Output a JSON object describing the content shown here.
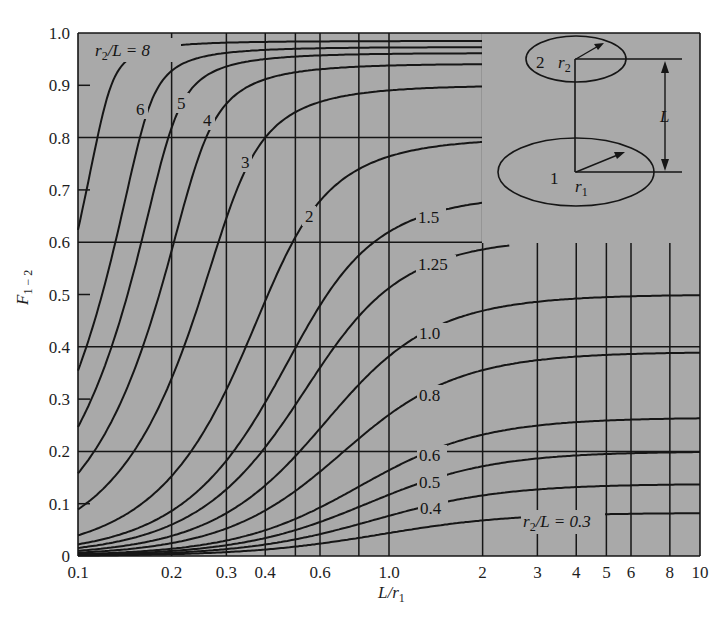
{
  "chart_data": {
    "type": "line",
    "title": "",
    "xlabel": "L/r1",
    "ylabel": "F1-2",
    "xscale": "log",
    "xlim": [
      0.1,
      10
    ],
    "ylim": [
      0,
      1.0
    ],
    "grid": true,
    "x_ticks": [
      0.1,
      0.2,
      0.3,
      0.4,
      0.6,
      1.0,
      2,
      3,
      4,
      5,
      6,
      8,
      10
    ],
    "x_tick_labels": [
      "0.1",
      "0.2",
      "0.3",
      "0.4",
      "0.6",
      "1.0",
      "2",
      "3",
      "4",
      "5",
      "6",
      "8",
      "10"
    ],
    "y_ticks": [
      0,
      0.1,
      0.2,
      0.3,
      0.4,
      0.5,
      0.6,
      0.7,
      0.8,
      0.9,
      1.0
    ],
    "y_tick_labels": [
      "0",
      "0.1",
      "0.2",
      "0.3",
      "0.4",
      "0.5",
      "0.6",
      "0.7",
      "0.8",
      "0.9",
      "1.0"
    ],
    "parameter": "r2/L",
    "x": [
      0.1,
      0.2,
      0.3,
      0.5,
      1.0,
      2,
      3,
      5,
      10
    ],
    "series": [
      {
        "name": "r2/L = 8",
        "r2L": 8,
        "label": "r2/L = 8",
        "values": [
          0.623,
          0.975,
          0.982,
          0.984,
          0.984,
          0.985,
          0.985,
          0.985,
          0.985
        ]
      },
      {
        "name": "r2/L = 6",
        "r2L": 6,
        "label": "6",
        "values": [
          0.355,
          0.928,
          0.962,
          0.97,
          0.973,
          0.973,
          0.973,
          0.973,
          0.973
        ]
      },
      {
        "name": "r2/L = 5",
        "r2L": 5,
        "label": "5",
        "values": [
          0.247,
          0.819,
          0.936,
          0.956,
          0.961,
          0.962,
          0.962,
          0.962,
          0.962
        ]
      },
      {
        "name": "r2/L = 4",
        "r2L": 4,
        "label": "4",
        "values": [
          0.158,
          0.584,
          0.865,
          0.925,
          0.94,
          0.941,
          0.941,
          0.941,
          0.941
        ]
      },
      {
        "name": "r2/L = 3",
        "r2L": 3,
        "label": "3",
        "values": [
          0.089,
          0.339,
          0.646,
          0.849,
          0.89,
          0.9,
          0.9,
          0.901,
          0.901
        ]
      },
      {
        "name": "r2/L = 2",
        "r2L": 2,
        "label": "2",
        "values": [
          0.04,
          0.153,
          0.318,
          0.61,
          0.764,
          0.79,
          0.797,
          0.8,
          0.801
        ]
      },
      {
        "name": "r2/L = 1.5",
        "r2L": 1.5,
        "label": "1.5",
        "values": [
          0.022,
          0.086,
          0.182,
          0.397,
          0.62,
          0.675,
          0.684,
          0.689,
          0.691
        ]
      },
      {
        "name": "r2/L = 1.25",
        "r2L": 1.25,
        "label": "1.25",
        "values": [
          0.016,
          0.06,
          0.127,
          0.289,
          0.512,
          0.586,
          0.6,
          0.607,
          0.609
        ]
      },
      {
        "name": "r2/L = 1.0",
        "r2L": 1.0,
        "label": "1.0",
        "values": [
          0.01,
          0.038,
          0.082,
          0.191,
          0.382,
          0.469,
          0.486,
          0.495,
          0.499
        ]
      },
      {
        "name": "r2/L = 0.8",
        "r2L": 0.8,
        "label": "0.8",
        "values": [
          0.006,
          0.025,
          0.053,
          0.125,
          0.27,
          0.355,
          0.374,
          0.385,
          0.389
        ]
      },
      {
        "name": "r2/L = 0.6",
        "r2L": 0.6,
        "label": "0.6",
        "values": [
          0.004,
          0.014,
          0.03,
          0.071,
          0.164,
          0.232,
          0.25,
          0.26,
          0.264
        ]
      },
      {
        "name": "r2/L = 0.5",
        "r2L": 0.5,
        "label": "0.5",
        "values": [
          0.003,
          0.01,
          0.021,
          0.05,
          0.117,
          0.172,
          0.187,
          0.196,
          0.199
        ]
      },
      {
        "name": "r2/L = 0.4",
        "r2L": 0.4,
        "label": "0.4",
        "values": [
          0.002,
          0.006,
          0.013,
          0.032,
          0.077,
          0.116,
          0.127,
          0.134,
          0.137
        ]
      },
      {
        "name": "r2/L = 0.3",
        "r2L": 0.3,
        "label": "r2/L = 0.3",
        "values": [
          0.001,
          0.004,
          0.008,
          0.018,
          0.044,
          0.068,
          0.075,
          0.08,
          0.082
        ]
      }
    ],
    "annotations": [
      "Inset: coaxial parallel disks; disk 1 radius r1 (bottom), disk 2 radius r2 (top), separation L"
    ],
    "legend": "inline curve labels"
  },
  "axes": {
    "y_title_main": "F",
    "y_title_sub": "1 − 2",
    "x_title_main": "L/r",
    "x_title_sub": "1"
  },
  "curve_labels": {
    "top_prefix_r": "r",
    "top_prefix_sub": "2",
    "top_prefix_rest": "/L = 8",
    "l6": "6",
    "l5": "5",
    "l4": "4",
    "l3": "3",
    "l2": "2",
    "l15": "1.5",
    "l125": "1.25",
    "l10": "1.0",
    "l08": "0.8",
    "l06": "0.6",
    "l05": "0.5",
    "l04": "0.4",
    "bottom_prefix_r": "r",
    "bottom_prefix_sub": "2",
    "bottom_prefix_rest": "/L = 0.3"
  },
  "inset": {
    "disk_top_number": "2",
    "disk_top_radius_r": "r",
    "disk_top_radius_sub": "2",
    "disk_bottom_number": "1",
    "disk_bottom_radius_r": "r",
    "disk_bottom_radius_sub": "1",
    "separation": "L"
  },
  "colors": {
    "background": "#a9a9a9",
    "ink": "#161616",
    "page": "#ffffff"
  }
}
